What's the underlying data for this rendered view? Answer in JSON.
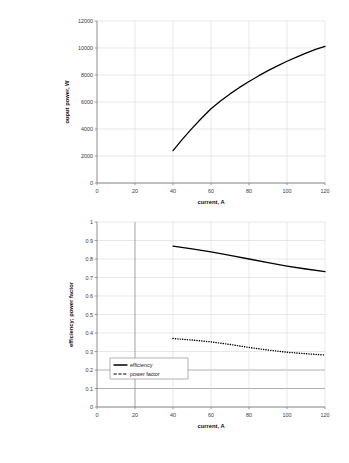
{
  "panels": [
    {
      "id": "a",
      "label": "(a)"
    },
    {
      "id": "b",
      "label": "(b)"
    }
  ],
  "colors": {
    "series": "#000000",
    "grid": "#d9d9d9",
    "grid_emphasis": "#9a9a9a",
    "axis": "#808080",
    "background": "#ffffff",
    "text": "#1a1a1a"
  },
  "chart_data": [
    {
      "id": "panel-a",
      "type": "line",
      "title": "",
      "xlabel": "current, A",
      "ylabel": "ouput power, W",
      "xlim": [
        0,
        120
      ],
      "ylim": [
        0,
        12000
      ],
      "xticks": [
        0,
        20,
        40,
        60,
        80,
        100,
        120
      ],
      "xtick_labels": [
        "0",
        "20",
        "40",
        "60",
        "80",
        "100",
        "120"
      ],
      "yticks": [
        0,
        2000,
        4000,
        6000,
        8000,
        10000,
        12000
      ],
      "ytick_labels": [
        "0",
        "2000",
        "4000",
        "6000",
        "8000",
        "10000",
        "12000"
      ],
      "grid": true,
      "legend": false,
      "series": [
        {
          "name": "ouput power",
          "style": "solid",
          "x": [
            40,
            45,
            50,
            55,
            60,
            65,
            70,
            75,
            80,
            85,
            90,
            95,
            100,
            105,
            110,
            115,
            120
          ],
          "y": [
            2400,
            3250,
            4050,
            4800,
            5500,
            6080,
            6600,
            7080,
            7520,
            7930,
            8320,
            8680,
            9020,
            9330,
            9620,
            9890,
            10120
          ]
        }
      ]
    },
    {
      "id": "panel-b",
      "type": "line",
      "title": "",
      "xlabel": "current, A",
      "ylabel": "efficiency; power factor",
      "xlim": [
        0,
        120
      ],
      "ylim": [
        0,
        1
      ],
      "xticks": [
        0,
        20,
        40,
        60,
        80,
        100,
        120
      ],
      "xtick_labels": [
        "0",
        "20",
        "40",
        "60",
        "80",
        "100",
        "120"
      ],
      "yticks": [
        0,
        0.1,
        0.2,
        0.3,
        0.4,
        0.5,
        0.6,
        0.7,
        0.8,
        0.9,
        1
      ],
      "ytick_labels": [
        "0",
        "0.1",
        "0.2",
        "0.3",
        "0.4",
        "0.5",
        "0.6",
        "0.7",
        "0.8",
        "0.9",
        "1"
      ],
      "grid": true,
      "legend": true,
      "legend_position": "lower-left",
      "legend_entries": [
        {
          "label": "efficiency",
          "style": "solid"
        },
        {
          "label": "power factor",
          "style": "dotted"
        }
      ],
      "series": [
        {
          "name": "efficiency",
          "style": "solid",
          "x": [
            40,
            50,
            60,
            70,
            80,
            90,
            100,
            110,
            120
          ],
          "y": [
            0.87,
            0.855,
            0.838,
            0.82,
            0.8,
            0.78,
            0.762,
            0.746,
            0.732
          ]
        },
        {
          "name": "power factor",
          "style": "dotted",
          "x": [
            40,
            50,
            60,
            70,
            80,
            90,
            100,
            110,
            120
          ],
          "y": [
            0.37,
            0.362,
            0.352,
            0.338,
            0.322,
            0.308,
            0.296,
            0.288,
            0.281
          ]
        }
      ]
    }
  ]
}
